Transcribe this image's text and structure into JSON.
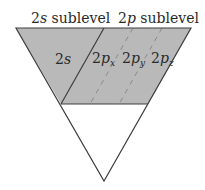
{
  "labels": {
    "left_header": {
      "main": "2",
      "italic": "s",
      "rest": " sublevel"
    },
    "right_header": {
      "main": "2",
      "italic": "p",
      "rest": " sublevel"
    }
  },
  "orbitals": [
    {
      "num": "2",
      "letter": "s",
      "sub": ""
    },
    {
      "num": "2",
      "letter": "p",
      "sub": "x"
    },
    {
      "num": "2",
      "letter": "p",
      "sub": "y"
    },
    {
      "num": "2",
      "letter": "p",
      "sub": "z"
    }
  ],
  "colors": {
    "fill": "#b9b9b9",
    "outline": "#3e3e3e",
    "dash": "#8c8c8c",
    "background": "#ffffff"
  }
}
